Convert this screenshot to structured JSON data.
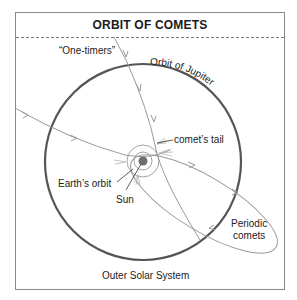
{
  "title": "ORBIT OF COMETS",
  "labels": {
    "one_timers": "“One-timers”",
    "orbit_of_jupiter": "Orbit of Jupiter",
    "comets_tail": "comet’s tail",
    "earths_orbit": "Earth’s orbit",
    "sun": "Sun",
    "periodic_line1": "Periodic",
    "periodic_line2": "comets",
    "outer_solar_system": "Outer Solar System"
  },
  "colors": {
    "jupiter_orbit": "#555555",
    "comet_path": "#9a9a9a",
    "sun": "#6e6e6e",
    "frame": "#8a8a8a",
    "text": "#222222"
  }
}
